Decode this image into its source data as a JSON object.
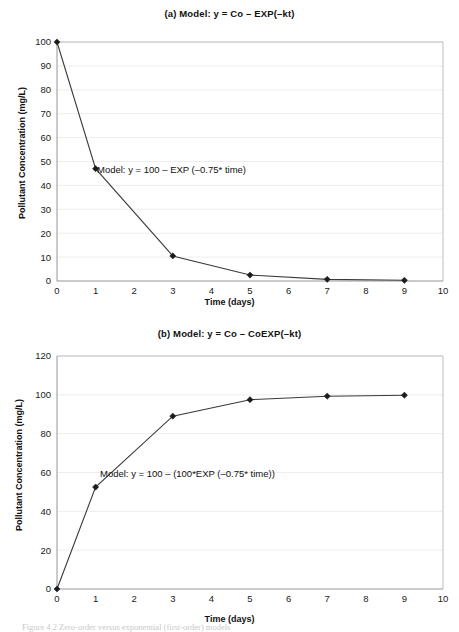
{
  "figure": {
    "caption": "Figure 4.2   Zero-order versus exponential (first-order) models"
  },
  "panel_a": {
    "title": "(a) Model: y = Co – EXP(–kt)",
    "xlabel": "Time (days)",
    "ylabel": "Pollutant Concentration (mg/L)",
    "annotation": "Model: y = 100 – EXP (–0.75* time)"
  },
  "panel_b": {
    "title": "(b) Model: y = Co – CoEXP(–kt)",
    "xlabel": "Time (days)",
    "ylabel": "Pollutant Concentration (mg/L)",
    "annotation": "Model: y = 100 – (100*EXP (–0.75* time))"
  },
  "chart_data": [
    {
      "type": "line",
      "id": "panel-a",
      "title": "(a) Model: y = Co – EXP(–kt)",
      "xlabel": "Time (days)",
      "ylabel": "Pollutant Concentration (mg/L)",
      "annotation": "Model: y = 100 – EXP (–0.75* time)",
      "xlim": [
        0,
        10
      ],
      "ylim": [
        0,
        100
      ],
      "xticks": [
        0,
        1,
        2,
        3,
        4,
        5,
        6,
        7,
        8,
        9,
        10
      ],
      "yticks": [
        0,
        10,
        20,
        30,
        40,
        50,
        60,
        70,
        80,
        90,
        100
      ],
      "grid": "horizontal",
      "legend": "none",
      "marker": "diamond",
      "x": [
        0,
        1,
        3,
        5,
        7,
        9
      ],
      "y": [
        100,
        47,
        10.5,
        2.5,
        0.7,
        0.3
      ]
    },
    {
      "type": "line",
      "id": "panel-b",
      "title": "(b) Model: y = Co – CoEXP(–kt)",
      "xlabel": "Time (days)",
      "ylabel": "Pollutant Concentration (mg/L)",
      "annotation": "Model: y = 100 – (100*EXP (–0.75* time))",
      "xlim": [
        0,
        10
      ],
      "ylim": [
        0,
        120
      ],
      "xticks": [
        0,
        1,
        2,
        3,
        4,
        5,
        6,
        7,
        8,
        9,
        10
      ],
      "yticks": [
        0,
        20,
        40,
        60,
        80,
        100,
        120
      ],
      "grid": "horizontal",
      "legend": "none",
      "marker": "diamond",
      "x": [
        0,
        1,
        3,
        5,
        7,
        9
      ],
      "y": [
        0,
        52.5,
        89,
        97.5,
        99.3,
        99.8
      ]
    }
  ]
}
